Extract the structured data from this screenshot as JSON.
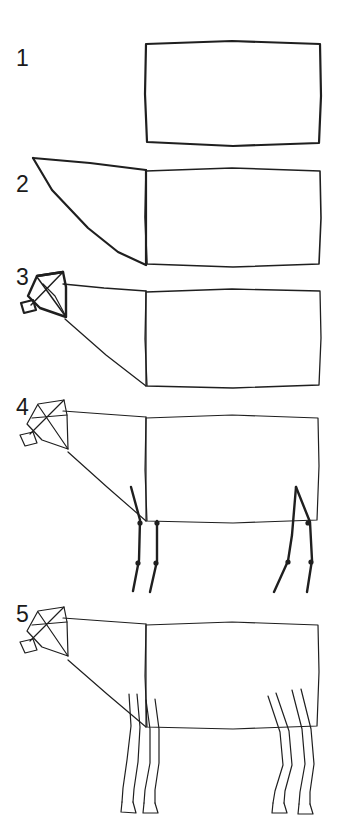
{
  "page": {
    "background_color": "#ffffff",
    "ink_color": "#1f1f1f",
    "width": 339,
    "height": 822
  },
  "steps": [
    {
      "number": "1",
      "label": "Step 1: Body box",
      "description": "A single hand-drawn rectangle forming the body mass of the cow.",
      "number_position": {
        "x": 16,
        "y": 66
      },
      "shapes": [
        {
          "name": "body-rectangle",
          "type": "polyline",
          "closed": true,
          "stroke_width": 2.2,
          "points": "146,44 232,41 320,44 321,96 319,143 233,146 147,142 145,94"
        }
      ]
    },
    {
      "number": "2",
      "label": "Step 2: Neck wedge",
      "description": "A tapering wedge is added to the left of the body rectangle to form the neck.",
      "number_position": {
        "x": 16,
        "y": 192
      },
      "shapes": [
        {
          "name": "body-rectangle",
          "type": "polyline",
          "closed": true,
          "stroke_width": 1.6,
          "points": "146,171 232,168 320,171 321,218 319,264 233,267 147,264 145,217"
        },
        {
          "name": "neck-wedge-top",
          "type": "polyline",
          "closed": false,
          "stroke_width": 2.2,
          "points": "33,158 90,163 146,170"
        },
        {
          "name": "neck-wedge-underside",
          "type": "polyline",
          "closed": false,
          "stroke_width": 2.2,
          "points": "33,158 52,190 88,228 118,252 146,265"
        },
        {
          "name": "neck-body-divider",
          "type": "polyline",
          "closed": false,
          "stroke_width": 2.2,
          "points": "146,170 146,265"
        }
      ]
    },
    {
      "number": "3",
      "label": "Step 3: Head box",
      "description": "A boxy head with crossing diagonals and a small muzzle block is attached to the neck.",
      "number_position": {
        "x": 16,
        "y": 285
      },
      "shapes": [
        {
          "name": "body-rectangle",
          "type": "polyline",
          "closed": true,
          "stroke_width": 1.3,
          "points": "146,292 232,289 320,291 321,338 319,385 233,388 147,386 145,339"
        },
        {
          "name": "neck-top-line",
          "type": "polyline",
          "closed": false,
          "stroke_width": 1.3,
          "points": "63,284 104,288 146,291"
        },
        {
          "name": "neck-bottom-line",
          "type": "polyline",
          "closed": false,
          "stroke_width": 1.3,
          "points": "65,319 106,355 146,386"
        },
        {
          "name": "neck-body-divider",
          "type": "polyline",
          "closed": false,
          "stroke_width": 1.3,
          "points": "146,291 146,386"
        },
        {
          "name": "head-box-outline",
          "type": "polyline",
          "closed": true,
          "stroke_width": 2.4,
          "points": "37,276 63,272 66,287 66,317 40,308 28,296"
        },
        {
          "name": "head-box-top-edge",
          "type": "polyline",
          "closed": false,
          "stroke_width": 2.4,
          "points": "37,276 63,272"
        },
        {
          "name": "head-diagonal-a",
          "type": "polyline",
          "closed": false,
          "stroke_width": 1.5,
          "points": "37,277 66,317"
        },
        {
          "name": "head-diagonal-b",
          "type": "polyline",
          "closed": false,
          "stroke_width": 1.5,
          "points": "63,272 31,305"
        },
        {
          "name": "head-inner-curve",
          "type": "polyline",
          "closed": false,
          "stroke_width": 1.2,
          "points": "43,284 55,296 63,311 66,317"
        },
        {
          "name": "muzzle-box",
          "type": "polyline",
          "closed": true,
          "stroke_width": 2.2,
          "points": "21,303 33,300 36,310 24,313"
        }
      ]
    },
    {
      "number": "4",
      "label": "Step 4: Leg armature",
      "description": "Skeleton lines with joint dots mark the fore and hind legs beneath the body.",
      "number_position": {
        "x": 16,
        "y": 415
      },
      "shapes": [
        {
          "name": "body-rectangle",
          "type": "polyline",
          "closed": true,
          "stroke_width": 1.2,
          "points": "146,418 232,415 318,418 319,466 317,520 233,523 147,521 145,470"
        },
        {
          "name": "neck-top-line",
          "type": "polyline",
          "closed": false,
          "stroke_width": 1.2,
          "points": "63,411 104,414 146,417"
        },
        {
          "name": "neck-bottom-line",
          "type": "polyline",
          "closed": false,
          "stroke_width": 1.2,
          "points": "68,452 107,487 146,521"
        },
        {
          "name": "neck-body-divider",
          "type": "polyline",
          "closed": false,
          "stroke_width": 1.2,
          "points": "146,417 146,521"
        },
        {
          "name": "head-box-outline",
          "type": "polyline",
          "closed": true,
          "stroke_width": 1.2,
          "points": "38,404 64,400 67,415 68,449 42,440 27,424"
        },
        {
          "name": "head-diagonal-a",
          "type": "polyline",
          "closed": false,
          "stroke_width": 1.2,
          "points": "38,405 68,449"
        },
        {
          "name": "head-diagonal-b",
          "type": "polyline",
          "closed": false,
          "stroke_width": 1.2,
          "points": "64,400 30,434"
        },
        {
          "name": "head-cross-line",
          "type": "polyline",
          "closed": false,
          "stroke_width": 1.2,
          "points": "32,418 67,415"
        },
        {
          "name": "muzzle-box",
          "type": "polyline",
          "closed": true,
          "stroke_width": 1.2,
          "points": "20,435 33,432 37,443 25,446"
        },
        {
          "name": "foreleg-front-bone",
          "type": "polyline",
          "closed": false,
          "stroke_width": 2.4,
          "points": "131,487 140,520 139,560 133,591"
        },
        {
          "name": "foreleg-rear-bone",
          "type": "polyline",
          "closed": false,
          "stroke_width": 2.4,
          "points": "157,521 157,561 150,592"
        },
        {
          "name": "hindleg-front-bone",
          "type": "polyline",
          "closed": false,
          "stroke_width": 2.4,
          "points": "296,487 292,535 288,561 274,592"
        },
        {
          "name": "hindleg-rear-bone",
          "type": "polyline",
          "closed": false,
          "stroke_width": 2.4,
          "points": "296,487 310,522 312,560 307,592"
        }
      ],
      "joints": [
        {
          "name": "foreleg-front-knee",
          "x": 140,
          "y": 523
        },
        {
          "name": "foreleg-front-fetlock",
          "x": 138,
          "y": 563
        },
        {
          "name": "foreleg-rear-knee",
          "x": 157,
          "y": 523
        },
        {
          "name": "foreleg-rear-fetlock",
          "x": 156,
          "y": 563
        },
        {
          "name": "hindleg-hock",
          "x": 308,
          "y": 523
        },
        {
          "name": "hindleg-fetlock",
          "x": 311,
          "y": 562
        },
        {
          "name": "hindleg-front-fetlock",
          "x": 288,
          "y": 562
        }
      ]
    },
    {
      "number": "5",
      "label": "Step 5: Finished cow",
      "description": "The armature is fleshed out: legs become tapering outlines ending in hooves, giving a complete cow.",
      "number_position": {
        "x": 16,
        "y": 622
      },
      "shapes": [
        {
          "name": "body-outline",
          "type": "polyline",
          "closed": true,
          "stroke_width": 1.2,
          "points": "146,625 232,622 318,625 319,672 317,726 233,729 147,727 145,676"
        },
        {
          "name": "neck-top-line",
          "type": "polyline",
          "closed": false,
          "stroke_width": 1.2,
          "points": "63,618 104,621 146,624"
        },
        {
          "name": "neck-bottom-line",
          "type": "polyline",
          "closed": false,
          "stroke_width": 1.2,
          "points": "68,660 107,694 146,727"
        },
        {
          "name": "shoulder-divider",
          "type": "polyline",
          "closed": false,
          "stroke_width": 1.2,
          "points": "146,624 146,727"
        },
        {
          "name": "head-box-outline",
          "type": "polyline",
          "closed": true,
          "stroke_width": 1.2,
          "points": "38,611 64,607 67,622 68,656 42,647 27,631"
        },
        {
          "name": "head-diagonal-a",
          "type": "polyline",
          "closed": false,
          "stroke_width": 1.2,
          "points": "38,612 68,656"
        },
        {
          "name": "head-diagonal-b",
          "type": "polyline",
          "closed": false,
          "stroke_width": 1.2,
          "points": "64,607 30,641"
        },
        {
          "name": "head-cross-line",
          "type": "polyline",
          "closed": false,
          "stroke_width": 1.2,
          "points": "32,625 67,622"
        },
        {
          "name": "muzzle-box",
          "type": "polyline",
          "closed": true,
          "stroke_width": 1.2,
          "points": "20,642 33,639 37,650 25,653"
        },
        {
          "name": "foreleg-left-outer",
          "type": "polyline",
          "closed": false,
          "stroke_width": 1.2,
          "points": "129,694 131,726 127,760 123,788 122,802"
        },
        {
          "name": "foreleg-left-inner",
          "type": "polyline",
          "closed": false,
          "stroke_width": 1.2,
          "points": "137,694 140,727 138,762 134,789 133,802"
        },
        {
          "name": "foreleg-left-hoof",
          "type": "polyline",
          "closed": false,
          "stroke_width": 1.2,
          "points": "122,802 121,812 136,813 133,802"
        },
        {
          "name": "foreleg-right-outer",
          "type": "polyline",
          "closed": false,
          "stroke_width": 1.2,
          "points": "146,700 150,729 150,763 145,790 144,803"
        },
        {
          "name": "foreleg-right-inner",
          "type": "polyline",
          "closed": false,
          "stroke_width": 1.2,
          "points": "155,699 159,729 159,763 155,790 155,803"
        },
        {
          "name": "foreleg-right-hoof",
          "type": "polyline",
          "closed": false,
          "stroke_width": 1.2,
          "points": "144,803 143,813 158,813 155,803"
        },
        {
          "name": "hindleg-left-outer",
          "type": "polyline",
          "closed": false,
          "stroke_width": 1.2,
          "points": "268,696 280,732 283,765 275,791 273,803"
        },
        {
          "name": "hindleg-left-inner",
          "type": "polyline",
          "closed": false,
          "stroke_width": 1.2,
          "points": "276,693 289,731 292,765 285,791 284,803"
        },
        {
          "name": "hindleg-left-hoof",
          "type": "polyline",
          "closed": false,
          "stroke_width": 1.2,
          "points": "273,803 272,813 287,813 284,803"
        },
        {
          "name": "hindleg-right-outer",
          "type": "polyline",
          "closed": false,
          "stroke_width": 1.2,
          "points": "292,690 302,729 305,764 300,792 299,804"
        },
        {
          "name": "hindleg-right-inner",
          "type": "polyline",
          "closed": false,
          "stroke_width": 1.2,
          "points": "301,689 311,729 314,764 310,792 310,804"
        },
        {
          "name": "hindleg-right-hoof",
          "type": "polyline",
          "closed": false,
          "stroke_width": 1.2,
          "points": "299,804 298,814 313,814 310,804"
        }
      ]
    }
  ]
}
